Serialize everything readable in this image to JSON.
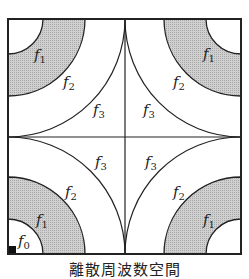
{
  "diagram": {
    "caption": "離散周波数空間",
    "colors": {
      "shade": "#bdbdbd",
      "line": "#222222",
      "background": "#ffffff"
    },
    "regions": {
      "f0": "f0",
      "f1": "f1",
      "f2": "f2",
      "f3": "f3"
    },
    "labels": [
      {
        "id": "tl_f1",
        "base": "f",
        "sub": "1"
      },
      {
        "id": "tl_f2",
        "base": "f",
        "sub": "2"
      },
      {
        "id": "tr_f1",
        "base": "f",
        "sub": "1"
      },
      {
        "id": "tr_f2",
        "base": "f",
        "sub": "2"
      },
      {
        "id": "c_tl_f3",
        "base": "f",
        "sub": "3"
      },
      {
        "id": "c_tr_f3",
        "base": "f",
        "sub": "3"
      },
      {
        "id": "c_bl_f3",
        "base": "f",
        "sub": "3"
      },
      {
        "id": "c_br_f3",
        "base": "f",
        "sub": "3"
      },
      {
        "id": "bl_f2",
        "base": "f",
        "sub": "2"
      },
      {
        "id": "bl_f1",
        "base": "f",
        "sub": "1"
      },
      {
        "id": "bl_f0",
        "base": "f",
        "sub": "0"
      },
      {
        "id": "br_f2",
        "base": "f",
        "sub": "2"
      },
      {
        "id": "br_f1",
        "base": "f",
        "sub": "1"
      }
    ]
  }
}
